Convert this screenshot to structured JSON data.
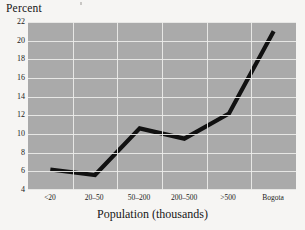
{
  "chart_data": {
    "type": "line",
    "title": "",
    "xlabel": "Population (thousands)",
    "ylabel": "Percent",
    "categories": [
      "<20",
      "20–50",
      "50–200",
      "200–500",
      ">500",
      "Bogota"
    ],
    "values": [
      6.2,
      5.6,
      10.6,
      9.5,
      12.2,
      21.0
    ],
    "ylim": [
      4,
      22
    ],
    "yticks": [
      22,
      20,
      18,
      16,
      14,
      12,
      10,
      8,
      6,
      4
    ],
    "ytick_labels": [
      "22",
      "20",
      "18",
      "16",
      "14",
      "12",
      "10",
      "8",
      "6",
      "4"
    ],
    "grid": true,
    "legend": false,
    "series": [
      {
        "name": "Percent",
        "values": [
          6.2,
          5.6,
          10.6,
          9.5,
          12.2,
          21.0
        ]
      }
    ],
    "colors": {
      "line": "#111111",
      "plot_background": "#aaaaaa",
      "grid": "#ededea",
      "page_background": "#f6f5f3",
      "text": "#1a1a1a"
    }
  }
}
